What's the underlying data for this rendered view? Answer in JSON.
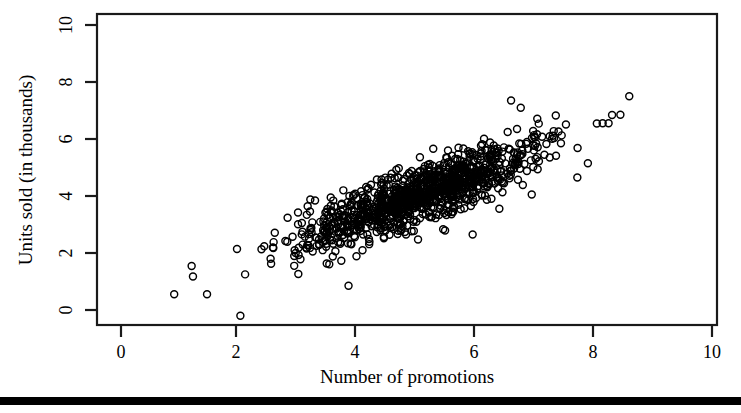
{
  "figure": {
    "background_color": "#ffffff",
    "ink_color": "#000000",
    "width": 741,
    "height": 413,
    "bottom_rule_color": "#000000"
  },
  "axis_titles": {
    "x": "Number of promotions",
    "y": "Units sold (in thousands)"
  },
  "ticks": {
    "x_labels": [
      "0",
      "2",
      "4",
      "6",
      "8",
      "10"
    ],
    "y_labels": [
      "0",
      "2",
      "4",
      "6",
      "8",
      "10"
    ]
  },
  "chart_data": {
    "type": "scatter",
    "title": "",
    "xlabel": "Number of promotions",
    "ylabel": "Units sold (in thousands)",
    "xlim": [
      -0.4,
      10.4
    ],
    "ylim": [
      -0.55,
      10.45
    ],
    "xticks": [
      0,
      2,
      4,
      6,
      8,
      10
    ],
    "yticks": [
      0,
      2,
      4,
      6,
      8,
      10
    ],
    "grid": false,
    "legend": null,
    "marker": "open-circle",
    "marker_size_px": 7,
    "n_points": 1100,
    "relationship": "strong positive linear correlation",
    "cluster": {
      "x_mean": 5.0,
      "y_mean": 4.0,
      "x_sd": 1.05,
      "y_sd": 0.95,
      "correlation": 0.86,
      "x_range": [
        2.0,
        8.1
      ],
      "y_range": [
        0.8,
        7.0
      ]
    },
    "outliers": [
      {
        "x": 0.9,
        "y": 0.55
      },
      {
        "x": 2.02,
        "y": -0.2
      },
      {
        "x": 2.1,
        "y": 1.25
      },
      {
        "x": 3.85,
        "y": 0.85
      },
      {
        "x": 5.95,
        "y": 2.65
      },
      {
        "x": 6.6,
        "y": 7.35
      },
      {
        "x": 6.95,
        "y": 4.05
      },
      {
        "x": 7.9,
        "y": 5.15
      },
      {
        "x": 8.15,
        "y": 6.55
      },
      {
        "x": 8.25,
        "y": 6.55
      },
      {
        "x": 8.45,
        "y": 6.85
      },
      {
        "x": 8.6,
        "y": 7.5
      }
    ]
  }
}
